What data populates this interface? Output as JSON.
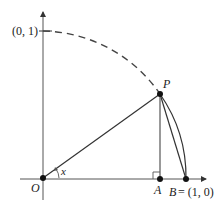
{
  "diagram": {
    "type": "unit-circle-sector",
    "labels": {
      "y_tick": "(0, 1)",
      "origin": "O",
      "point_p": "P",
      "point_a": "A",
      "point_b": "B",
      "point_b_coord": "= (1, 0)",
      "angle": "x"
    },
    "colors": {
      "stroke": "#333333",
      "axis": "#555555",
      "dash_arc": "#444444",
      "point": "#111111"
    }
  }
}
